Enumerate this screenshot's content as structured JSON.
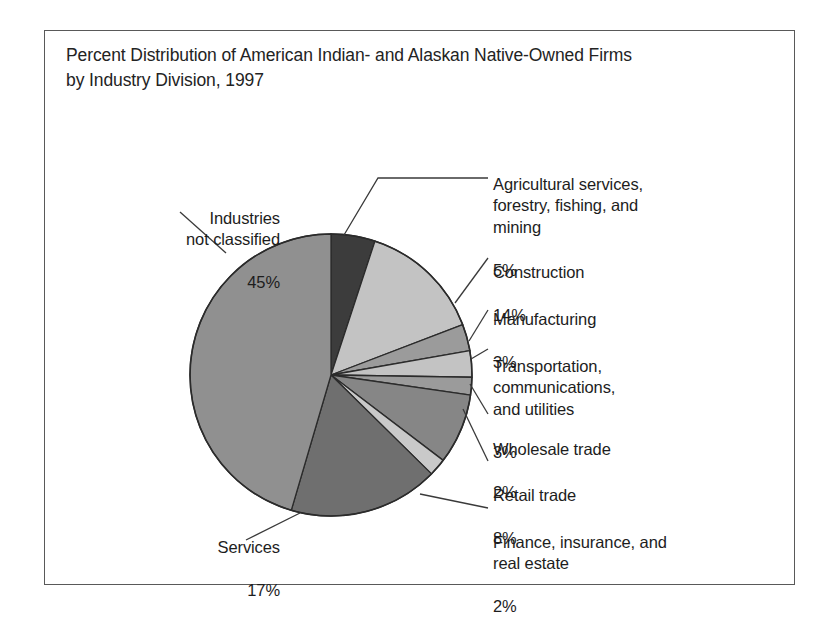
{
  "figure": {
    "title_line1": "Percent Distribution of American Indian- and Alaskan Native-Owned Firms",
    "title_line2": "by Industry Division, 1997",
    "border_color": "#595959",
    "background_color": "#ffffff"
  },
  "chart_data": {
    "type": "pie",
    "title": "Percent Distribution of American Indian- and Alaskan Native-Owned Firms by Industry Division, 1997",
    "subtitle": "",
    "xlabel": "",
    "ylabel": "",
    "units": "percent",
    "start_angle_deg": 0,
    "direction": "clockwise",
    "legend_position": "callout-labels",
    "grid": false,
    "categories": [
      "Agricultural services, forestry, fishing, and mining",
      "Construction",
      "Manufacturing",
      "Transportation, communications, and utilities",
      "Wholesale trade",
      "Retail trade",
      "Finance, insurance, and real estate",
      "Services",
      "Industries not classified"
    ],
    "values": [
      5,
      14,
      3,
      3,
      2,
      8,
      2,
      17,
      45
    ],
    "value_labels": [
      "5%",
      "14%",
      "3%",
      "3%",
      "2%",
      "8%",
      "2%",
      "17%",
      "45%"
    ],
    "colors": [
      "#3c3c3c",
      "#c3c3c3",
      "#9b9b9b",
      "#c3c3c3",
      "#9b9b9b",
      "#868686",
      "#c9c9c9",
      "#6f6f6f",
      "#909090"
    ],
    "slice_edge_color": "#2b2b2b",
    "total": 99
  },
  "labels": {
    "agriculture": {
      "name": "Agricultural services,\nforestry, fishing, and\nmining",
      "value": "5%"
    },
    "construction": {
      "name": "Construction",
      "value": "14%"
    },
    "manufacturing": {
      "name": "Manufacturing",
      "value": "3%"
    },
    "transportation": {
      "name": "Transportation,\ncommunications,\nand utilities",
      "value": "3%"
    },
    "wholesale": {
      "name": "Wholesale trade",
      "value": "2%"
    },
    "retail": {
      "name": "Retail trade",
      "value": "8%"
    },
    "finance": {
      "name": "Finance, insurance, and\nreal estate",
      "value": "2%"
    },
    "industries_not_classified": {
      "name": "Industries\nnot classified",
      "value": "45%"
    },
    "services": {
      "name": "Services",
      "value": "17%"
    }
  }
}
